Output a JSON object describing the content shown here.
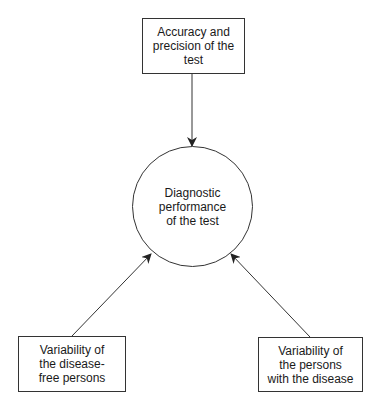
{
  "diagram": {
    "top": {
      "label": "Accuracy and\nprecision of the\ntest"
    },
    "center": {
      "label": "Diagnostic\nperformance\nof the test"
    },
    "bottom_left": {
      "label": "Variability of\nthe disease-\nfree persons"
    },
    "bottom_right": {
      "label": "Variability of\nthe persons\nwith the disease"
    },
    "edges": [
      {
        "from": "top",
        "to": "center"
      },
      {
        "from": "bottom_left",
        "to": "center"
      },
      {
        "from": "bottom_right",
        "to": "center"
      }
    ],
    "colors": {
      "stroke": "#333333",
      "background": "#ffffff"
    }
  }
}
